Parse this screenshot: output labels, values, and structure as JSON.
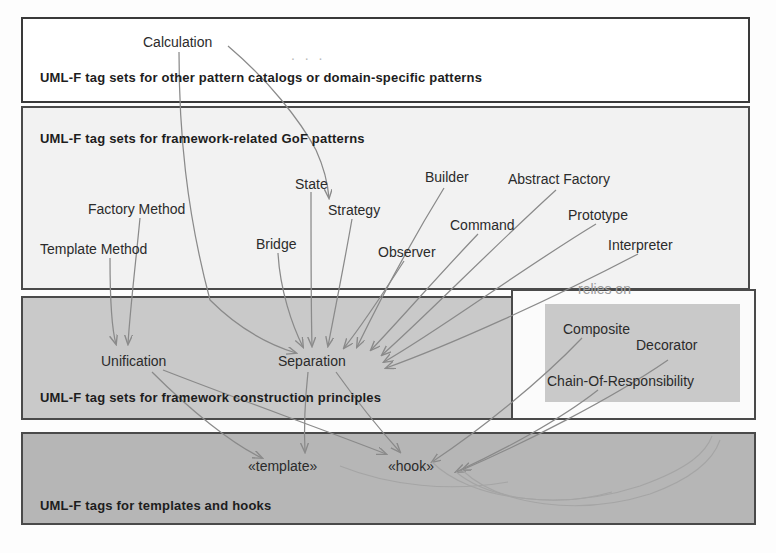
{
  "diagram": {
    "panels": [
      {
        "id": "other-patterns",
        "title": "UML-F tag sets for other pattern catalogs or domain-specific patterns"
      },
      {
        "id": "gof-patterns",
        "title": "UML-F tag sets for framework-related GoF patterns"
      },
      {
        "id": "construction-principles",
        "title": "UML-F tag sets for framework construction principles"
      },
      {
        "id": "templates-hooks",
        "title": "UML-F tags for templates and hooks"
      }
    ],
    "labels": {
      "calculation": "Calculation",
      "ellipsis": ". . .",
      "relies_on": "relies on",
      "state": "State",
      "builder": "Builder",
      "abstract_factory": "Abstract Factory",
      "factory_method": "Factory Method",
      "strategy": "Strategy",
      "command": "Command",
      "prototype": "Prototype",
      "template_method": "Template Method",
      "bridge": "Bridge",
      "observer": "Observer",
      "interpreter": "Interpreter",
      "composite": "Composite",
      "decorator": "Decorator",
      "chain_of_responsibility": "Chain-Of-Responsibility",
      "unification": "Unification",
      "separation": "Separation",
      "template_tag": "«template»",
      "hook_tag": "«hook»"
    },
    "colors": {
      "panel_white": "#ffffff",
      "panel_light": "#f2f2f2",
      "panel_mid": "#c9c9c9",
      "panel_dark": "#b6b6b6",
      "border": "#4a4a4a",
      "text": "#2b2b2b",
      "wire": "#8a8a8a",
      "muted": "#9a9a9a"
    }
  }
}
